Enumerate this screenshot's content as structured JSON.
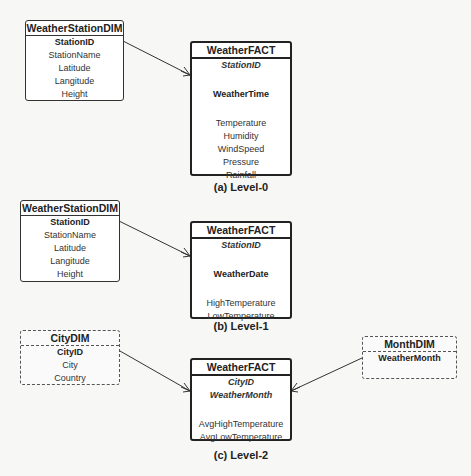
{
  "levels": [
    {
      "caption": "(a) Level-0",
      "dimensions": [
        {
          "title": "WeatherStationDIM",
          "key": "StationID",
          "attributes": [
            "StationName",
            "Latitude",
            "Langitude",
            "Height"
          ],
          "style": "solid"
        }
      ],
      "fact": {
        "title": "WeatherFACT",
        "foreign_keys": [
          "StationID"
        ],
        "time_key": "WeatherTime",
        "measures": [
          "Temperature",
          "Humidity",
          "WindSpeed",
          "Pressure",
          "Rainfall"
        ]
      }
    },
    {
      "caption": "(b) Level-1",
      "dimensions": [
        {
          "title": "WeatherStationDIM",
          "key": "StationID",
          "attributes": [
            "StationName",
            "Latitude",
            "Langitude",
            "Height"
          ],
          "style": "solid"
        }
      ],
      "fact": {
        "title": "WeatherFACT",
        "foreign_keys": [
          "StationID"
        ],
        "time_key": "WeatherDate",
        "measures": [
          "HighTemperature",
          "LowTemperature"
        ]
      }
    },
    {
      "caption": "(c) Level-2",
      "dimensions": [
        {
          "title": "CityDIM",
          "key": "CityID",
          "attributes": [
            "City",
            "Country"
          ],
          "style": "dashed"
        },
        {
          "title": "MonthDIM",
          "key": "WeatherMonth",
          "attributes": [],
          "style": "dashed"
        }
      ],
      "fact": {
        "title": "WeatherFACT",
        "foreign_keys": [
          "CityID",
          "WeatherMonth"
        ],
        "measures": [
          "AvgHighTemperature",
          "AvgLowTemperature"
        ]
      }
    }
  ],
  "relationship_notation": "crow-foot (one-to-many)"
}
